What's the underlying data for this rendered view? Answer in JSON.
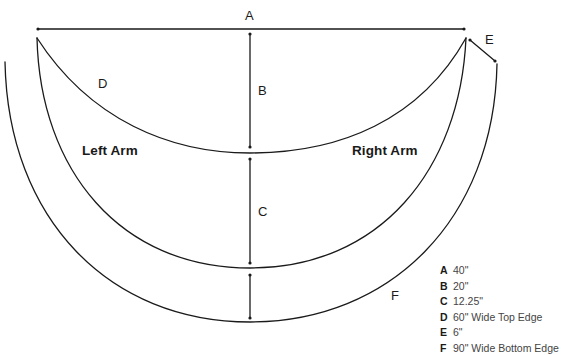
{
  "diagram": {
    "labels": {
      "A": "A",
      "B": "B",
      "C": "C",
      "D": "D",
      "E": "E",
      "F": "F"
    },
    "regions": {
      "left_arm": "Left Arm",
      "right_arm": "Right Arm"
    },
    "stroke_color": "#1a1a1a"
  },
  "legend": {
    "items": [
      {
        "key": "A",
        "value": "40\""
      },
      {
        "key": "B",
        "value": "20\""
      },
      {
        "key": "C",
        "value": "12.25\""
      },
      {
        "key": "D",
        "value": "60\" Wide Top Edge"
      },
      {
        "key": "E",
        "value": "6\""
      },
      {
        "key": "F",
        "value": "90\" Wide Bottom Edge"
      }
    ]
  }
}
